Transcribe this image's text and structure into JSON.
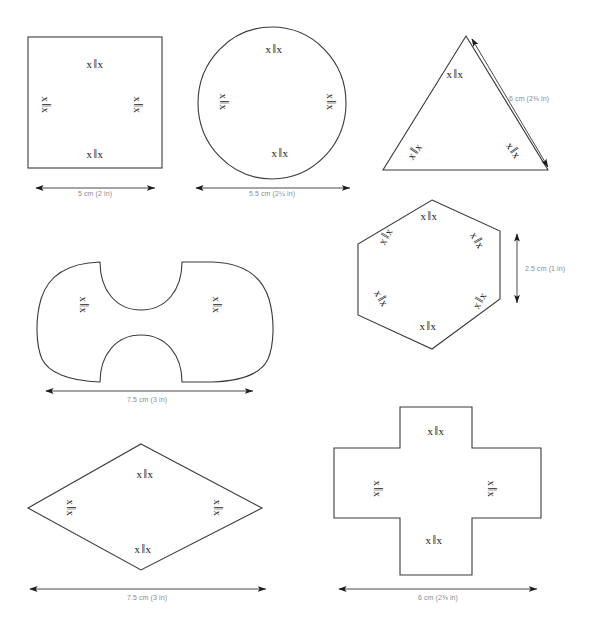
{
  "sheet": {
    "title": "Shape templates with symmetry marks and dimensions",
    "background_color": "#ffffff",
    "outline_color": "#3b3b3b",
    "label_color": "#8d8d8d",
    "mark_color": "#1b1b1b"
  },
  "mark_glyphs": {
    "x_left": "x",
    "bars": "‖",
    "x_right": "x"
  },
  "shapes": [
    {
      "id": "square",
      "name": "square",
      "dimension_label": "5 cm (2 in)",
      "dimension_orientation": "horizontal",
      "marks": [
        "x ‖ x",
        "x ‖ x",
        "x ‖ x",
        "x ‖ x"
      ],
      "mark_count": 4
    },
    {
      "id": "circle",
      "name": "circle",
      "dimension_label": "5.5 cm (2¼ in)",
      "dimension_orientation": "horizontal",
      "marks": [
        "x ‖ x",
        "x ‖ x",
        "x ‖ x",
        "x ‖ x"
      ],
      "mark_count": 4
    },
    {
      "id": "triangle",
      "name": "triangle",
      "dimension_label": "6 cm (2⅜ in)",
      "dimension_orientation": "diagonal",
      "marks": [
        "x ‖ x",
        "x ‖ x",
        "x ‖ x"
      ],
      "mark_count": 3
    },
    {
      "id": "dogbone",
      "name": "curved concave shape",
      "dimension_label": "7.5 cm (3 in)",
      "dimension_orientation": "horizontal",
      "marks": [
        "x ‖ x",
        "x ‖ x"
      ],
      "mark_count": 2
    },
    {
      "id": "hexagon",
      "name": "hexagon",
      "dimension_label": "2.5 cm (1 in)",
      "dimension_orientation": "vertical",
      "marks": [
        "x ‖ x",
        "x ‖ x",
        "x ‖ x",
        "x ‖ x",
        "x ‖ x",
        "x ‖ x"
      ],
      "mark_count": 6
    },
    {
      "id": "rhombus",
      "name": "rhombus",
      "dimension_label": "7.5 cm (3 in)",
      "dimension_orientation": "horizontal",
      "marks": [
        "x ‖ x",
        "x ‖ x",
        "x ‖ x",
        "x ‖ x"
      ],
      "mark_count": 4
    },
    {
      "id": "cross",
      "name": "cross",
      "dimension_label": "6 cm (2⅜ in)",
      "dimension_orientation": "horizontal",
      "marks": [
        "x ‖ x",
        "x ‖ x",
        "x ‖ x",
        "x ‖ x"
      ],
      "mark_count": 4
    }
  ]
}
